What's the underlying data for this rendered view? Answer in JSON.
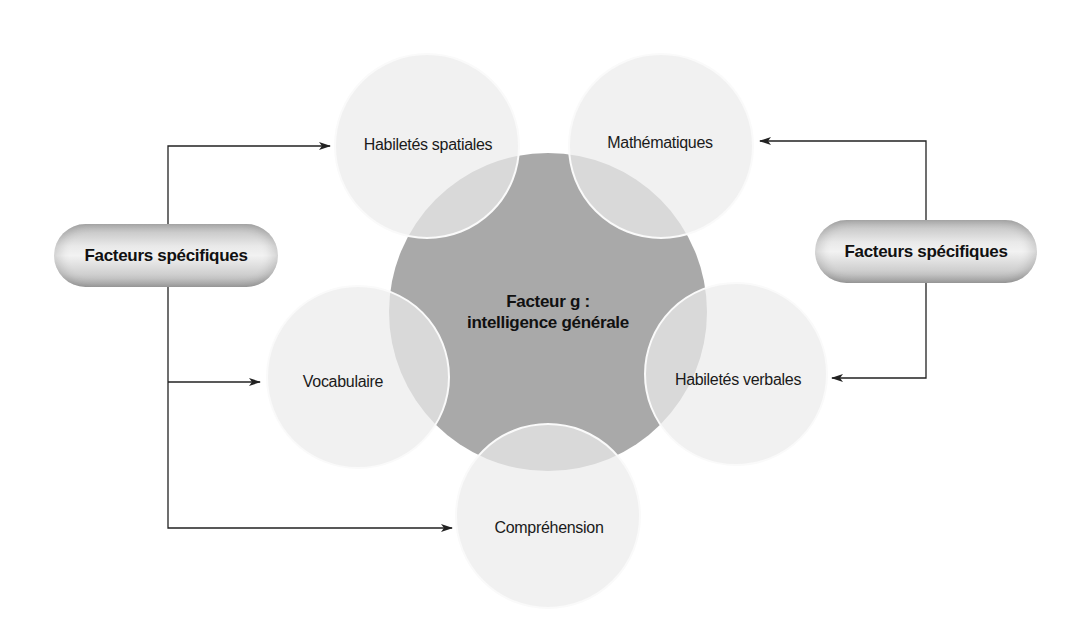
{
  "diagram": {
    "center": {
      "title": "Facteur g :",
      "subtitle": "intelligence générale"
    },
    "abilities": [
      {
        "label": "Habiletés spatiales"
      },
      {
        "label": "Mathématiques"
      },
      {
        "label": "Vocabulaire"
      },
      {
        "label": "Habiletés verbales"
      },
      {
        "label": "Compréhension"
      }
    ],
    "left_group": {
      "label": "Facteurs spécifiques"
    },
    "right_group": {
      "label": "Facteurs spécifiques"
    },
    "colors": {
      "center_fill": "#a9a9a9",
      "satellite_fill": "#e6e6e6",
      "satellite_stroke": "#f8f8f8",
      "arrow": "#222222"
    }
  }
}
